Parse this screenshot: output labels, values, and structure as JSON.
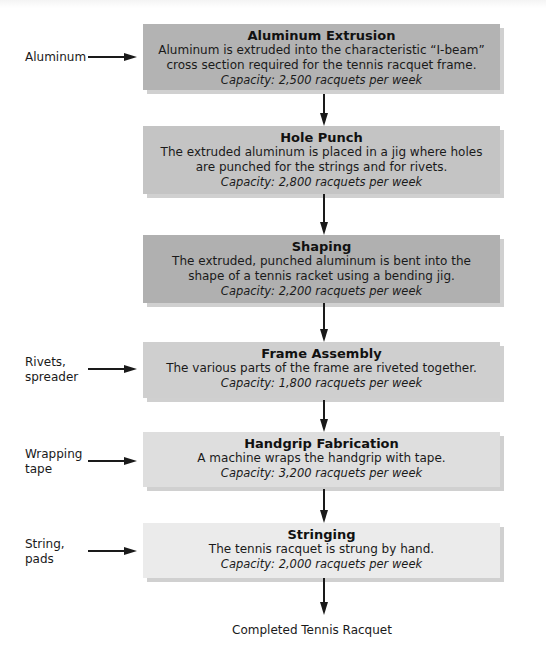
{
  "diagram": {
    "type": "process-flowchart",
    "stages": [
      {
        "title": "Aluminum Extrusion",
        "description": "Aluminum is extruded into the characteristic “I-beam” cross section required for the tennis racquet frame.",
        "capacity": "Capacity: 2,500 racquets per week",
        "capacity_value": 2500,
        "fill": "#b3b3b3",
        "input": "Aluminum"
      },
      {
        "title": "Hole Punch",
        "description": "The extruded aluminum is placed in a jig where holes are punched for the strings and for rivets.",
        "capacity": "Capacity: 2,800 racquets per week",
        "capacity_value": 2800,
        "fill": "#c4c4c4",
        "input": null
      },
      {
        "title": "Shaping",
        "description": "The extruded, punched aluminum is bent into the shape of a tennis racket using a bending jig.",
        "capacity": "Capacity: 2,200 racquets per week",
        "capacity_value": 2200,
        "fill": "#b0b0b0",
        "input": null
      },
      {
        "title": "Frame Assembly",
        "description": "The various parts of the frame are riveted together.",
        "capacity": "Capacity: 1,800 racquets per week",
        "capacity_value": 1800,
        "fill": "#cfcfcf",
        "input": "Rivets,\nspreader"
      },
      {
        "title": "Handgrip Fabrication",
        "description": "A machine wraps the handgrip with tape.",
        "capacity": "Capacity: 3,200 racquets per week",
        "capacity_value": 3200,
        "fill": "#dedede",
        "input": "Wrapping\ntape"
      },
      {
        "title": "Stringing",
        "description": "The tennis racquet is strung by hand.",
        "capacity": "Capacity: 2,000 racquets per week",
        "capacity_value": 2000,
        "fill": "#ebebeb",
        "input": "String,\npads"
      }
    ],
    "output": "Completed Tennis Racquet",
    "colors": {
      "arrow": "#1a1a1a",
      "text": "#1a1a1a",
      "shadow": "#969696"
    }
  }
}
